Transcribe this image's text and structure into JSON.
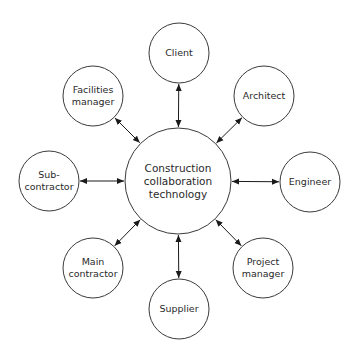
{
  "diagram": {
    "title": "",
    "colors": {
      "stroke": "#3a3a3a",
      "text": "#2a2a2a",
      "background": "#ffffff"
    },
    "center": {
      "id": "construction-collaboration-technology",
      "label": "Construction\ncollaboration\ntechnology",
      "cx": 178,
      "cy": 181,
      "r": 53
    },
    "nodes": [
      {
        "id": "client",
        "label": "Client",
        "cx": 179,
        "cy": 53,
        "r": 30
      },
      {
        "id": "architect",
        "label": "Architect",
        "cx": 264,
        "cy": 96,
        "r": 30
      },
      {
        "id": "engineer",
        "label": "Engineer",
        "cx": 310,
        "cy": 182,
        "r": 30
      },
      {
        "id": "project-manager",
        "label": "Project\nmanager",
        "cx": 263,
        "cy": 268,
        "r": 30
      },
      {
        "id": "supplier",
        "label": "Supplier",
        "cx": 179,
        "cy": 309,
        "r": 30
      },
      {
        "id": "main-contractor",
        "label": "Main\ncontractor",
        "cx": 93,
        "cy": 268,
        "r": 30
      },
      {
        "id": "sub-contractor",
        "label": "Sub-\ncontractor",
        "cx": 49,
        "cy": 181,
        "r": 30
      },
      {
        "id": "facilities-manager",
        "label": "Facilities\nmanager",
        "cx": 93,
        "cy": 96,
        "r": 30
      }
    ],
    "edges": [
      {
        "from": "construction-collaboration-technology",
        "to": "client",
        "arrows": "both"
      },
      {
        "from": "construction-collaboration-technology",
        "to": "architect",
        "arrows": "both"
      },
      {
        "from": "construction-collaboration-technology",
        "to": "engineer",
        "arrows": "both"
      },
      {
        "from": "construction-collaboration-technology",
        "to": "project-manager",
        "arrows": "both"
      },
      {
        "from": "construction-collaboration-technology",
        "to": "supplier",
        "arrows": "both"
      },
      {
        "from": "construction-collaboration-technology",
        "to": "main-contractor",
        "arrows": "both"
      },
      {
        "from": "construction-collaboration-technology",
        "to": "sub-contractor",
        "arrows": "both"
      },
      {
        "from": "construction-collaboration-technology",
        "to": "facilities-manager",
        "arrows": "both"
      }
    ]
  }
}
